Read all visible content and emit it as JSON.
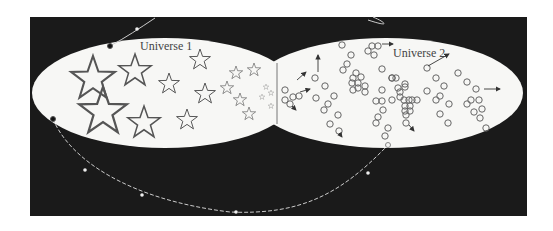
{
  "diagram": {
    "title": "",
    "labels": {
      "universe1": "Universe 1",
      "universe2": "Universe 2"
    },
    "colors": {
      "background": "#ffffff",
      "panel": "#1a1a1a",
      "universe_fill": "#f7f7f5",
      "stroke": "#555555",
      "path": "#cccccc"
    },
    "universes": [
      {
        "name": "Universe 1",
        "content": "stars"
      },
      {
        "name": "Universe 2",
        "content": "circles"
      }
    ]
  }
}
